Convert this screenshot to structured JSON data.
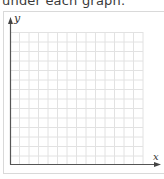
{
  "instruction_text": "under each graph.",
  "graph": {
    "y_axis_label": "y",
    "x_axis_label": "x",
    "grid": {
      "columns": 14,
      "rows": 14,
      "line_color": "#e0e0e0",
      "axis_color": "#555555"
    }
  }
}
